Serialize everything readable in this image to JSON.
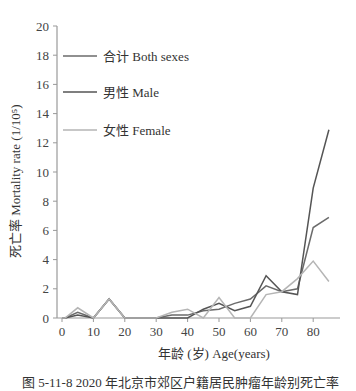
{
  "chart_data": {
    "type": "line",
    "title": "",
    "xlabel": "年龄 (岁) Age(years)",
    "ylabel": "死亡率 Mortality rate (1/10⁵)",
    "xlim": [
      0,
      85
    ],
    "ylim": [
      0,
      20
    ],
    "x_ticks": [
      0,
      10,
      20,
      30,
      40,
      50,
      60,
      70,
      80
    ],
    "y_ticks": [
      0,
      2,
      4,
      6,
      8,
      10,
      12,
      14,
      16,
      18,
      20
    ],
    "grid": false,
    "legend_position": "upper-left",
    "x": [
      0,
      1,
      5,
      10,
      15,
      20,
      25,
      30,
      35,
      40,
      45,
      50,
      55,
      60,
      65,
      70,
      75,
      80,
      85
    ],
    "series": [
      {
        "name": "合计 Both sexes",
        "color": "#6b6b6b",
        "values": [
          0,
          0,
          0.4,
          0,
          1.3,
          0,
          0,
          0,
          0.2,
          0.2,
          0.5,
          0.6,
          1.0,
          1.3,
          2.2,
          1.8,
          2.0,
          6.2,
          6.9
        ]
      },
      {
        "name": "男性 Male",
        "color": "#555555",
        "values": [
          0,
          0,
          0.2,
          0,
          1.3,
          0,
          0,
          0,
          0,
          0,
          0.6,
          1.0,
          0.5,
          0.8,
          2.9,
          1.8,
          1.6,
          8.9,
          12.9
        ]
      },
      {
        "name": "女性 Female",
        "color": "#b5b5b5",
        "values": [
          0,
          0,
          0.7,
          0,
          1.3,
          0,
          0,
          0,
          0.4,
          0.6,
          0,
          1.4,
          0,
          0,
          1.6,
          1.8,
          2.7,
          3.9,
          2.5
        ]
      }
    ]
  },
  "legend": {
    "items": [
      {
        "label": "合计  Both sexes"
      },
      {
        "label": "男性  Male"
      },
      {
        "label": "女性  Female"
      }
    ]
  },
  "axes": {
    "x_title": "年龄 (岁) Age(years)",
    "y_title": "死亡率 Mortality rate (1/10⁵)"
  },
  "caption": "图 5-11-8  2020 年北京市郊区户籍居民肿瘤年龄别死亡率"
}
